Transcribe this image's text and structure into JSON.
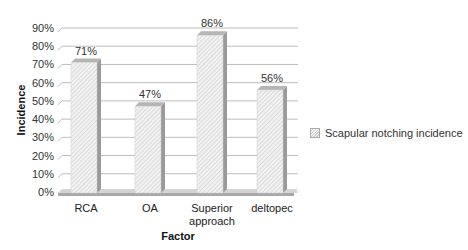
{
  "chart_data": {
    "type": "bar",
    "title": "",
    "xlabel": "Factor",
    "ylabel": "Incidence",
    "categories": [
      "RCA",
      "OA",
      "Superior approach",
      "deltopec"
    ],
    "category_lines": [
      [
        "RCA"
      ],
      [
        "OA"
      ],
      [
        "Superior",
        "approach"
      ],
      [
        "deltopec"
      ]
    ],
    "series": [
      {
        "name": "Scapular notching incidence",
        "values": [
          71,
          47,
          86,
          56
        ]
      }
    ],
    "value_labels": [
      "71%",
      "47%",
      "86%",
      "56%"
    ],
    "yticks": [
      "0%",
      "10%",
      "20%",
      "30%",
      "40%",
      "50%",
      "60%",
      "70%",
      "80%",
      "90%"
    ],
    "ylim": [
      0,
      90
    ],
    "grid": true,
    "legend_position": "right",
    "style": "3d-hatched",
    "colors": {
      "bar_fill": "#eeeeee",
      "bar_hatch": "#c8c8c8",
      "bar_side": "#9a9a9a",
      "bar_top": "#b5b5b5",
      "grid": "#bdbdbd",
      "floor": "#a8a8a8"
    }
  },
  "legend": {
    "label": "Scapular notching incidence"
  }
}
